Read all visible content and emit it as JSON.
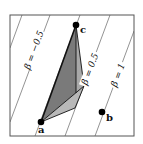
{
  "figure": {
    "frame": {
      "x": 10,
      "y": 15,
      "width": 124,
      "height": 121
    },
    "colors": {
      "frame": "#555555",
      "contour": "#777777",
      "dark_fill": "#7a7a7a",
      "mid_fill": "#a8a8a8",
      "light_fill": "#b8b8b8",
      "edge": "#111111",
      "point": "#000000"
    },
    "points": [
      {
        "name": "a",
        "label": "a",
        "x": 41,
        "y": 122,
        "lx": 38,
        "ly": 133
      },
      {
        "name": "b",
        "label": "b",
        "x": 102,
        "y": 112,
        "lx": 106,
        "ly": 121
      },
      {
        "name": "c",
        "label": "c",
        "x": 76,
        "y": 25,
        "lx": 80,
        "ly": 33
      }
    ],
    "contours": [
      {
        "label": "",
        "x1": 10,
        "y1": 48,
        "x2": 22,
        "y2": 15
      },
      {
        "label": "β = −0.5",
        "x1": 10,
        "y1": 122,
        "x2": 50,
        "y2": 15,
        "label_x": 34,
        "label_y": 50
      },
      {
        "label": "",
        "x1": 35,
        "y1": 136,
        "x2": 80,
        "y2": 15
      },
      {
        "label": "β = 0.5",
        "x1": 65,
        "y1": 136,
        "x2": 110,
        "y2": 15,
        "label_x": 90,
        "label_y": 69
      },
      {
        "label": "β = 1",
        "x1": 95,
        "y1": 136,
        "x2": 134,
        "y2": 31,
        "label_x": 118,
        "label_y": 75
      }
    ],
    "polygons": {
      "dark": "41,122 76,25 76,93",
      "mid": "76,25 84,86 76,93",
      "light": "41,122 84,86 75,108"
    },
    "edges": [
      {
        "x1": 41,
        "y1": 122,
        "x2": 76,
        "y2": 25
      },
      {
        "x1": 76,
        "y1": 25,
        "x2": 84,
        "y2": 86
      },
      {
        "x1": 84,
        "y1": 86,
        "x2": 75,
        "y2": 108
      },
      {
        "x1": 75,
        "y1": 108,
        "x2": 41,
        "y2": 122
      },
      {
        "x1": 41,
        "y1": 122,
        "x2": 84,
        "y2": 86
      },
      {
        "x1": 76,
        "y1": 25,
        "x2": 76,
        "y2": 93
      }
    ],
    "label_rotation_deg": -69.6
  }
}
